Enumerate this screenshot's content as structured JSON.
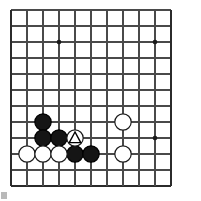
{
  "figure": {
    "kind": "go-board-diagram",
    "width": 201,
    "height": 201
  },
  "board": {
    "origin_x": 11,
    "origin_y": 10,
    "spacing": 16,
    "cols": 11,
    "rows": 12,
    "line_color": "#4a4a4a",
    "edge_color": "#2b2b2b",
    "background_color": "#ffffff",
    "line_width": 1.1,
    "edge_width": 2.0,
    "edges": {
      "left": true,
      "right": true,
      "top": false,
      "bottom": true
    },
    "star_points": [
      {
        "col": 3,
        "row": 2,
        "x": 59,
        "y": 42
      },
      {
        "col": 9,
        "row": 2,
        "x": 155,
        "y": 42
      },
      {
        "col": 9,
        "row": 8,
        "x": 155,
        "y": 138
      }
    ],
    "star_radius": 2.3,
    "star_color": "#1a1a1a"
  },
  "stones": {
    "radius": 8.2,
    "black_fill": "#151515",
    "black_edge": "#000000",
    "white_fill": "#ffffff",
    "white_edge": "#1a1a1a",
    "list": [
      {
        "id": "b1",
        "color": "black",
        "col": 2,
        "row": 7,
        "x": 43,
        "y": 122,
        "mark": "none"
      },
      {
        "id": "b2",
        "color": "black",
        "col": 2,
        "row": 8,
        "x": 43,
        "y": 138,
        "mark": "none"
      },
      {
        "id": "b3",
        "color": "black",
        "col": 3,
        "row": 8,
        "x": 59,
        "y": 138,
        "mark": "none"
      },
      {
        "id": "b4",
        "color": "black",
        "col": 4,
        "row": 9,
        "x": 75,
        "y": 154,
        "mark": "none"
      },
      {
        "id": "b5",
        "color": "black",
        "col": 5,
        "row": 9,
        "x": 91,
        "y": 154,
        "mark": "none"
      },
      {
        "id": "w1",
        "color": "white",
        "col": 1,
        "row": 9,
        "x": 27,
        "y": 154,
        "mark": "none"
      },
      {
        "id": "w2",
        "color": "white",
        "col": 2,
        "row": 9,
        "x": 43,
        "y": 154,
        "mark": "none"
      },
      {
        "id": "w3",
        "color": "white",
        "col": 3,
        "row": 9,
        "x": 59,
        "y": 154,
        "mark": "none"
      },
      {
        "id": "w4",
        "color": "white",
        "col": 4,
        "row": 8,
        "x": 75,
        "y": 138,
        "mark": "triangle"
      },
      {
        "id": "w5",
        "color": "white",
        "col": 7,
        "row": 7,
        "x": 123,
        "y": 122,
        "mark": "none"
      },
      {
        "id": "w6",
        "color": "white",
        "col": 7,
        "row": 9,
        "x": 123,
        "y": 154,
        "mark": "none"
      }
    ]
  },
  "marks": {
    "triangle": {
      "stroke_color": "#000000",
      "stroke_width": 1.4,
      "size": 11.5,
      "label": "triangle-mark"
    }
  },
  "artifact": {
    "color": "#b9b9b9",
    "label": "page-edge-artifact"
  }
}
